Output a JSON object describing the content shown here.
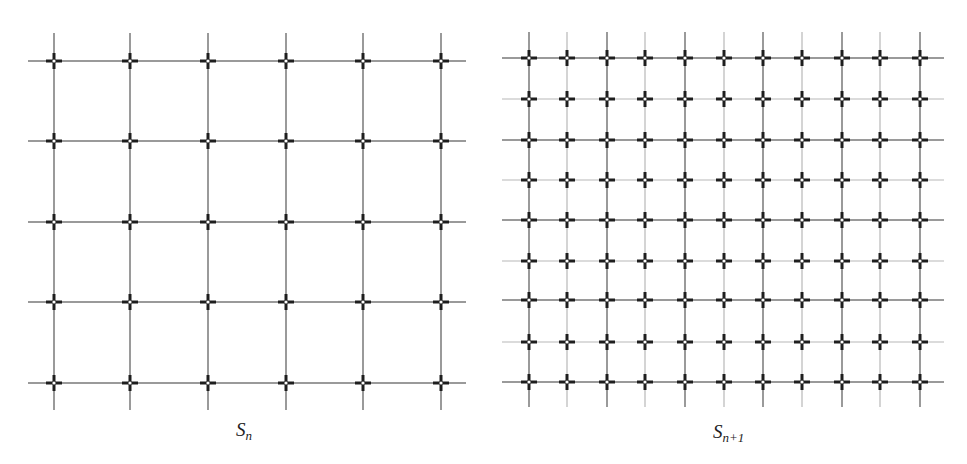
{
  "figure": {
    "panels": [
      {
        "id": "S_n",
        "label_main": "S",
        "label_sub": "n",
        "columns_x": [
          54,
          130,
          208,
          286,
          363,
          441
        ],
        "rows_y": [
          61,
          141,
          222,
          302,
          383
        ],
        "h_extent": [
          28,
          466
        ],
        "v_extent": [
          33,
          410
        ],
        "label_pos": [
          236,
          419
        ]
      },
      {
        "id": "S_n+1",
        "label_main": "S",
        "label_sub": "n+1",
        "columns_x": [
          529,
          567,
          607,
          645,
          685,
          724,
          763,
          802,
          842,
          880,
          920
        ],
        "rows_y": [
          58,
          99,
          140,
          180,
          220,
          261,
          300,
          342,
          382
        ],
        "h_extent": [
          502,
          944
        ],
        "v_extent": [
          32,
          407
        ],
        "label_pos": [
          713,
          421
        ]
      }
    ],
    "colors": {
      "line": "#9a9a9a",
      "line_thin": "#b8b8b8",
      "cross": "#1e1e1e",
      "background": "#ffffff"
    }
  }
}
